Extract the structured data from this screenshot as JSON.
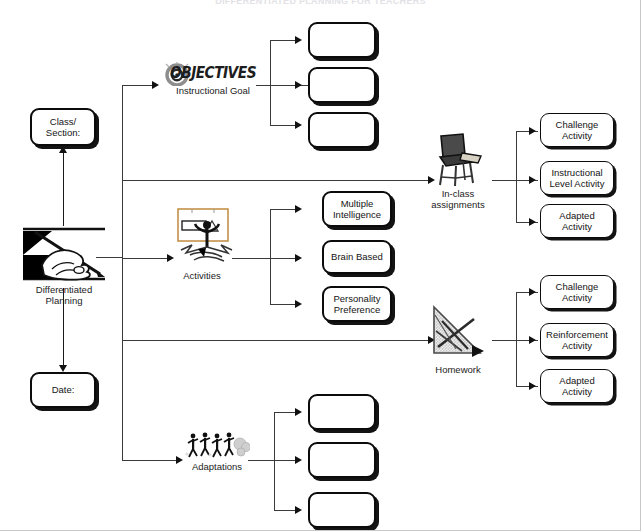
{
  "page": {
    "header_text": "DIFFERENTIATED PLANNING FOR TEACHERS",
    "width": 641,
    "height": 531,
    "background": "#ffffff",
    "line_color": "#3a3a3a",
    "text_color": "#141414"
  },
  "root": {
    "icon": "hand-writing-icon",
    "label": "Differentiated\nPlanning"
  },
  "meta_fields": [
    {
      "id": "class-section",
      "label": "Class/\nSection:",
      "value": ""
    },
    {
      "id": "date",
      "label": "Date:",
      "value": ""
    }
  ],
  "branches": [
    {
      "id": "instructional-goal",
      "icon": "objectives-target-icon",
      "icon_wordmark": "OBJECTIVES",
      "label": "Instructional Goal",
      "children": [
        {
          "id": "goal-1",
          "label": ""
        },
        {
          "id": "goal-2",
          "label": ""
        },
        {
          "id": "goal-3",
          "label": ""
        }
      ]
    },
    {
      "id": "in-class-assignments",
      "icon": "school-desk-chair-icon",
      "label": "In-class\nassignments",
      "children": [
        {
          "id": "inclass-1",
          "label": "Challenge\nActivity"
        },
        {
          "id": "inclass-2",
          "label": "Instructional\nLevel Activity"
        },
        {
          "id": "inclass-3",
          "label": "Adapted\nActivity"
        }
      ]
    },
    {
      "id": "activities",
      "icon": "presentation-person-icon",
      "label": "Activities",
      "children": [
        {
          "id": "activity-1",
          "label": "Multiple\nIntelligence"
        },
        {
          "id": "activity-2",
          "label": "Brain Based"
        },
        {
          "id": "activity-3",
          "label": "Personality\nPreference"
        }
      ]
    },
    {
      "id": "homework",
      "icon": "protractor-triangle-icon",
      "label": "Homework",
      "children": [
        {
          "id": "homework-1",
          "label": "Challenge\nActivity"
        },
        {
          "id": "homework-2",
          "label": "Reinforcement\nActivity"
        },
        {
          "id": "homework-3",
          "label": "Adapted\nActivity"
        }
      ]
    },
    {
      "id": "adaptations",
      "icon": "running-people-icon",
      "label": "Adaptations",
      "children": [
        {
          "id": "adaptation-1",
          "label": ""
        },
        {
          "id": "adaptation-2",
          "label": ""
        },
        {
          "id": "adaptation-3",
          "label": ""
        }
      ]
    }
  ]
}
